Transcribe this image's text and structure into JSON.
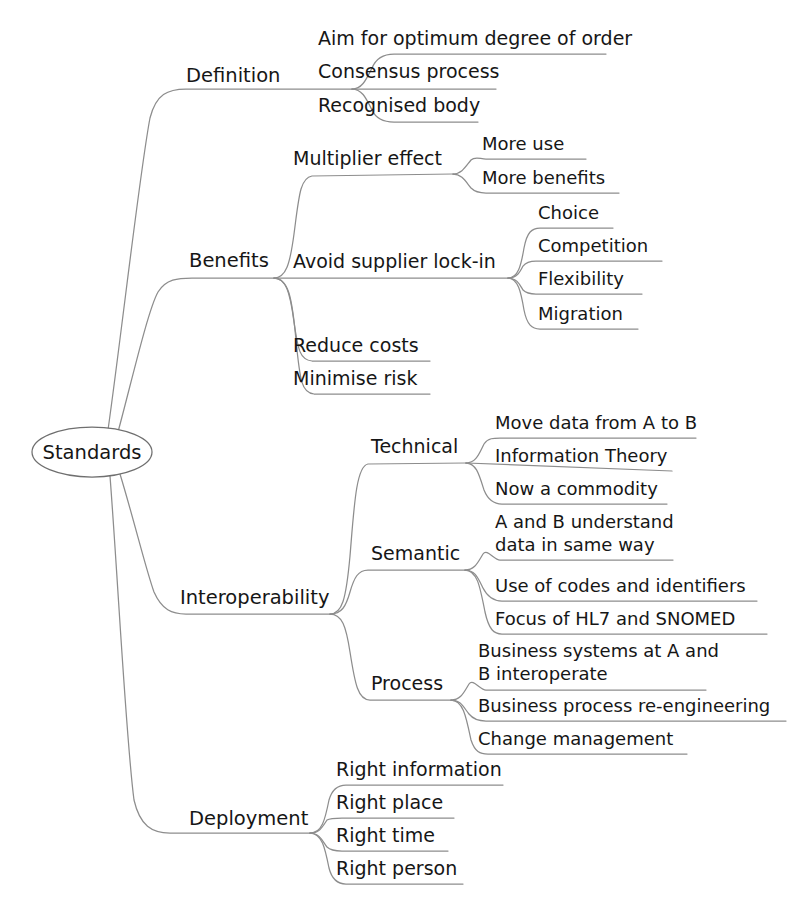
{
  "diagram": {
    "type": "mind-map",
    "title": "Standards",
    "orientation": "left-to-right",
    "style": {
      "background": "#ffffff",
      "line_color": "#8d8d8d",
      "text_color": "#161616",
      "root_shape": "ellipse"
    },
    "root": {
      "label": "Standards",
      "cx": 92,
      "cy": 452,
      "rx": 60,
      "ry": 25
    },
    "branches": [
      {
        "id": "definition",
        "label": "Definition",
        "label_x": 186,
        "label_y": 82,
        "hub_x": 352,
        "hub_y": 89,
        "children": [
          {
            "label": "Aim for optimum degree of order",
            "x": 318,
            "y": 45,
            "line_y": 54,
            "line_w": 288
          },
          {
            "label": "Consensus process",
            "x": 318,
            "y": 78,
            "line_y": 88,
            "line_w": 178
          },
          {
            "label": "Recognised body",
            "x": 318,
            "y": 112,
            "line_y": 122,
            "line_w": 160
          }
        ]
      },
      {
        "id": "benefits",
        "label": "Benefits",
        "label_x": 189,
        "label_y": 267,
        "hub_x": 274,
        "hub_y": 278,
        "children": [
          {
            "label": "Multiplier effect",
            "x": 293,
            "y": 165,
            "line_y": 174,
            "line_w": 160,
            "hub_x": 453,
            "hub_y": 174,
            "children": [
              {
                "label": "More use",
                "x": 482,
                "y": 150,
                "line_y": 159,
                "line_w": 104
              },
              {
                "label": "More benefits",
                "x": 482,
                "y": 184,
                "line_y": 193,
                "line_w": 137
              }
            ]
          },
          {
            "label": "Avoid supplier lock-in",
            "x": 293,
            "y": 268,
            "line_y": 278,
            "line_w": 215,
            "hub_x": 508,
            "hub_y": 278,
            "children": [
              {
                "label": "Choice",
                "x": 538,
                "y": 219,
                "line_y": 228,
                "line_w": 75
              },
              {
                "label": "Competition",
                "x": 538,
                "y": 252,
                "line_y": 261,
                "line_w": 124
              },
              {
                "label": "Flexibility",
                "x": 538,
                "y": 285,
                "line_y": 294,
                "line_w": 104
              },
              {
                "label": "Migration",
                "x": 538,
                "y": 320,
                "line_y": 329,
                "line_w": 100
              }
            ]
          },
          {
            "label": "Reduce costs",
            "x": 293,
            "y": 352,
            "line_y": 361,
            "line_w": 137
          },
          {
            "label": "Minimise risk",
            "x": 293,
            "y": 385,
            "line_y": 394,
            "line_w": 137
          }
        ]
      },
      {
        "id": "interoperability",
        "label": "Interoperability",
        "label_x": 180,
        "label_y": 604,
        "hub_x": 330,
        "hub_y": 614,
        "children": [
          {
            "label": "Technical",
            "x": 371,
            "y": 453,
            "line_y": 463,
            "line_w": 95,
            "hub_x": 466,
            "hub_y": 463,
            "children": [
              {
                "label": "Move data from A to B",
                "x": 495,
                "y": 429,
                "line_y": 438,
                "line_w": 201
              },
              {
                "label": "Information Theory",
                "x": 495,
                "y": 462,
                "line_y": 471,
                "line_w": 177
              },
              {
                "label": "Now a commodity",
                "x": 495,
                "y": 495,
                "line_y": 504,
                "line_w": 172
              }
            ]
          },
          {
            "label": "Semantic",
            "x": 371,
            "y": 560,
            "line_y": 570,
            "line_w": 94,
            "hub_x": 465,
            "hub_y": 570,
            "children": [
              {
                "label": "A and B understand",
                "label2": "data in same way",
                "x": 495,
                "y": 528,
                "y2": 551,
                "line_y": 560,
                "line_w": 178,
                "multiline": true
              },
              {
                "label": "Use of codes and identifiers",
                "x": 495,
                "y": 592,
                "line_y": 601,
                "line_w": 262
              },
              {
                "label": "Focus of HL7 and SNOMED",
                "x": 495,
                "y": 625,
                "line_y": 634,
                "line_w": 272
              }
            ]
          },
          {
            "label": "Process",
            "x": 371,
            "y": 690,
            "line_y": 700,
            "line_w": 80,
            "hub_x": 451,
            "hub_y": 700,
            "children": [
              {
                "label": "Business systems at A and",
                "label2": "B interoperate",
                "x": 478,
                "y": 657,
                "y2": 680,
                "line_y": 690,
                "line_w": 228,
                "multiline": true
              },
              {
                "label": "Business process re-engineering",
                "x": 478,
                "y": 712,
                "line_y": 721,
                "line_w": 308
              },
              {
                "label": "Change management",
                "x": 478,
                "y": 745,
                "line_y": 754,
                "line_w": 209
              }
            ]
          }
        ]
      },
      {
        "id": "deployment",
        "label": "Deployment",
        "label_x": 189,
        "label_y": 825,
        "hub_x": 310,
        "hub_y": 833,
        "children": [
          {
            "label": "Right information",
            "x": 336,
            "y": 776,
            "line_y": 785,
            "line_w": 167
          },
          {
            "label": "Right place",
            "x": 336,
            "y": 809,
            "line_y": 818,
            "line_w": 118
          },
          {
            "label": "Right time",
            "x": 336,
            "y": 842,
            "line_y": 851,
            "line_w": 112
          },
          {
            "label": "Right person",
            "x": 336,
            "y": 875,
            "line_y": 884,
            "line_w": 127
          }
        ]
      }
    ]
  }
}
